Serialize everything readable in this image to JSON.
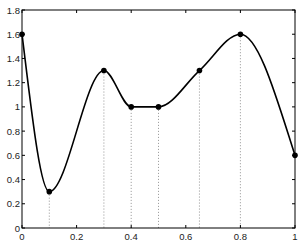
{
  "chart_data": {
    "type": "line",
    "title": "",
    "xlabel": "",
    "ylabel": "",
    "xlim": [
      0,
      1
    ],
    "ylim": [
      0,
      1.8
    ],
    "grid": false,
    "legend": null,
    "x_ticks": [
      0,
      0.2,
      0.4,
      0.6,
      0.8,
      1
    ],
    "x_tick_labels": [
      "0",
      "0.2",
      "0.4",
      "0.6",
      "0.8",
      "1"
    ],
    "y_ticks": [
      0,
      0.2,
      0.4,
      0.6,
      0.8,
      1,
      1.2,
      1.4,
      1.6,
      1.8
    ],
    "y_tick_labels": [
      "0",
      "0.2",
      "0.4",
      "0.6",
      "0.8",
      "1",
      "1.2",
      "1.4",
      "1.6",
      "1.8"
    ],
    "series": [
      {
        "name": "interpolating curve",
        "style": "solid line with dot markers at knots",
        "x": [
          0,
          0.1,
          0.3,
          0.4,
          0.5,
          0.65,
          0.8,
          1.0
        ],
        "y": [
          1.6,
          0.3,
          1.3,
          1.0,
          1.0,
          1.3,
          1.6,
          0.6
        ]
      }
    ],
    "annotations": "dotted vertical drop lines from each interior knot (x=0.1, 0.3, 0.4, 0.5, 0.65, 0.8) down to the x-axis"
  },
  "style": {
    "line_color": "#000000",
    "axis_color": "#000000",
    "dropline_color": "#777777",
    "background": "#ffffff"
  }
}
